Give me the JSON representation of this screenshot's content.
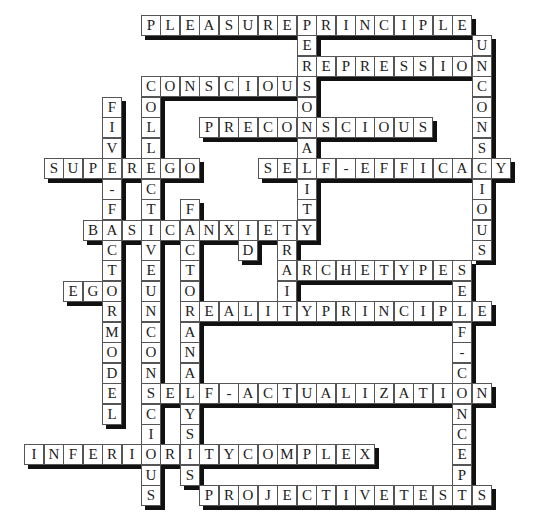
{
  "puzzle": {
    "type": "crossword-solution",
    "grid": {
      "origin_x": 141,
      "origin_y": 15,
      "cell_w": 19.45,
      "cell_h": 20.45
    },
    "colors": {
      "cell_bg": "#ffffff",
      "cell_border": "#555555",
      "shadow": "#111111",
      "text": "#222222"
    },
    "words": [
      {
        "answer": "PLEASUREPRINCIPLE",
        "dir": "across",
        "row": 0,
        "col": 0
      },
      {
        "answer": "PERSONALITY",
        "dir": "down",
        "row": 0,
        "col": 8
      },
      {
        "answer": "UNCONSCIOUS",
        "dir": "down",
        "row": 1,
        "col": 17
      },
      {
        "answer": "REPRESSION",
        "dir": "across",
        "row": 2,
        "col": 8
      },
      {
        "answer": "CONSCIOUS",
        "dir": "across",
        "row": 3,
        "col": 0
      },
      {
        "answer": "COLLECTIVEUNCONSCIOUS",
        "dir": "down",
        "row": 3,
        "col": 0
      },
      {
        "answer": "FIVE-FACTORMODEL",
        "dir": "down",
        "row": 4,
        "col": -2
      },
      {
        "answer": "PRECONSCIOUS",
        "dir": "across",
        "row": 5,
        "col": 3
      },
      {
        "answer": "SUPEREGO",
        "dir": "across",
        "row": 7,
        "col": -5
      },
      {
        "answer": "SELF-EFFICACY",
        "dir": "across",
        "row": 7,
        "col": 6
      },
      {
        "answer": "FACTORANALYSIS",
        "dir": "down",
        "row": 9,
        "col": 2
      },
      {
        "answer": "BASICANXIETY",
        "dir": "across",
        "row": 10,
        "col": -3
      },
      {
        "answer": "ID",
        "dir": "down",
        "row": 10,
        "col": 5
      },
      {
        "answer": "TRAIT",
        "dir": "down",
        "row": 10,
        "col": 7
      },
      {
        "answer": "ARCHETYPES",
        "dir": "across",
        "row": 12,
        "col": 7
      },
      {
        "answer": "SELF-CONCEPT",
        "dir": "down",
        "row": 12,
        "col": 16
      },
      {
        "answer": "EGO",
        "dir": "across",
        "row": 13,
        "col": -4
      },
      {
        "answer": "REALITYPRINCIPLE",
        "dir": "across",
        "row": 14,
        "col": 2
      },
      {
        "answer": "SELF-ACTUALIZATION",
        "dir": "across",
        "row": 18,
        "col": 0
      },
      {
        "answer": "INFERIORITYCOMPLEX",
        "dir": "across",
        "row": 21,
        "col": -6
      },
      {
        "answer": "PROJECTIVETESTS",
        "dir": "across",
        "row": 23,
        "col": 3
      }
    ]
  }
}
